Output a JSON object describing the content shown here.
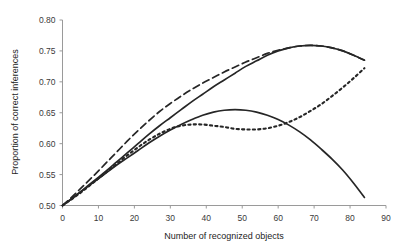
{
  "chart_data": {
    "type": "line",
    "title": "",
    "xlabel": "Number of recognized objects",
    "ylabel": "Proportion of correct inferences",
    "xlim": [
      0,
      90
    ],
    "ylim": [
      0.5,
      0.8
    ],
    "xticks": [
      0,
      10,
      20,
      30,
      40,
      50,
      60,
      70,
      80,
      90
    ],
    "xtick_labels": [
      "0",
      "10",
      "20",
      "30",
      "40",
      "50",
      "60",
      "70",
      "80",
      "90"
    ],
    "yticks": [
      0.5,
      0.55,
      0.6,
      0.65,
      0.7,
      0.75,
      0.8
    ],
    "ytick_labels": [
      "0.50",
      "0.55",
      "0.60",
      "0.65",
      "0.70",
      "0.75",
      "0.80"
    ],
    "grid": false,
    "legend": "none",
    "series": [
      {
        "name": "upper-solid",
        "style": "solid",
        "color": "#262626",
        "x": [
          0,
          3,
          6,
          9,
          12,
          15,
          18,
          21,
          24,
          27,
          30,
          33,
          36,
          39,
          42,
          45,
          48,
          51,
          54,
          57,
          60,
          63,
          66,
          69,
          72,
          75,
          78,
          81,
          84
        ],
        "y": [
          0.5,
          0.513,
          0.527,
          0.541,
          0.555,
          0.57,
          0.585,
          0.6,
          0.615,
          0.629,
          0.642,
          0.655,
          0.668,
          0.68,
          0.692,
          0.703,
          0.714,
          0.725,
          0.734,
          0.743,
          0.75,
          0.755,
          0.758,
          0.759,
          0.758,
          0.755,
          0.75,
          0.743,
          0.735
        ]
      },
      {
        "name": "dashed",
        "style": "dashed",
        "color": "#262626",
        "x": [
          0,
          3,
          6,
          9,
          12,
          15,
          18,
          21,
          24,
          27,
          30,
          33,
          36,
          39,
          42,
          45,
          48,
          51,
          54,
          57,
          60,
          63,
          66,
          69,
          72,
          75,
          78,
          81,
          84
        ],
        "y": [
          0.5,
          0.516,
          0.533,
          0.55,
          0.568,
          0.586,
          0.604,
          0.621,
          0.637,
          0.652,
          0.665,
          0.677,
          0.688,
          0.698,
          0.707,
          0.716,
          0.724,
          0.732,
          0.739,
          0.746,
          0.751,
          0.755,
          0.758,
          0.759,
          0.758,
          0.755,
          0.75,
          0.743,
          0.735
        ]
      },
      {
        "name": "dotted",
        "style": "dotted",
        "color": "#262626",
        "x": [
          0,
          3,
          6,
          9,
          12,
          15,
          18,
          21,
          24,
          27,
          30,
          33,
          36,
          39,
          42,
          45,
          48,
          51,
          54,
          57,
          60,
          63,
          66,
          69,
          72,
          75,
          78,
          81,
          84
        ],
        "y": [
          0.5,
          0.512,
          0.525,
          0.539,
          0.553,
          0.567,
          0.581,
          0.594,
          0.606,
          0.616,
          0.624,
          0.629,
          0.631,
          0.631,
          0.629,
          0.627,
          0.624,
          0.623,
          0.623,
          0.625,
          0.629,
          0.635,
          0.643,
          0.653,
          0.664,
          0.677,
          0.691,
          0.706,
          0.722
        ]
      },
      {
        "name": "lower-solid",
        "style": "solid",
        "color": "#262626",
        "x": [
          0,
          3,
          6,
          9,
          12,
          15,
          18,
          21,
          24,
          27,
          30,
          33,
          36,
          39,
          42,
          45,
          48,
          51,
          54,
          57,
          60,
          63,
          66,
          69,
          72,
          75,
          78,
          81,
          84
        ],
        "y": [
          0.5,
          0.513,
          0.526,
          0.539,
          0.552,
          0.565,
          0.577,
          0.589,
          0.601,
          0.612,
          0.622,
          0.631,
          0.639,
          0.646,
          0.651,
          0.654,
          0.655,
          0.654,
          0.651,
          0.646,
          0.639,
          0.63,
          0.619,
          0.606,
          0.591,
          0.575,
          0.557,
          0.536,
          0.513
        ]
      }
    ]
  }
}
